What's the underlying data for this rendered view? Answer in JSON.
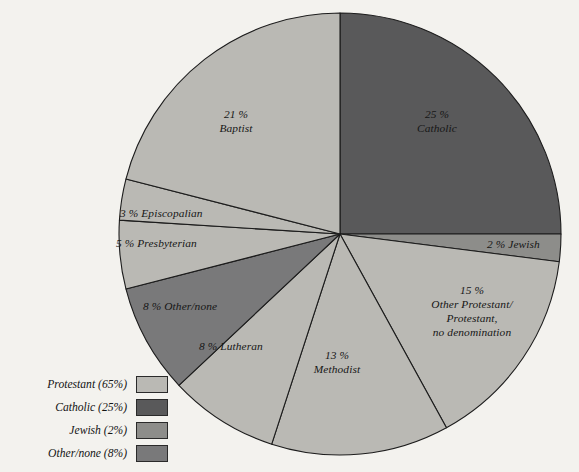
{
  "chart_data": {
    "type": "pie",
    "title": "",
    "subtitle": "",
    "xlabel": "",
    "ylabel": "",
    "units": "percent",
    "total": 100,
    "start_angle_deg": 0,
    "direction": "clockwise",
    "center": {
      "x": 340,
      "y": 234
    },
    "radius": 221,
    "categories": [
      "Catholic",
      "Jewish",
      "Other Protestant/ Protestant, no denomination",
      "Methodist",
      "Lutheran",
      "Other/none",
      "Presbyterian",
      "Episcopalian",
      "Baptist"
    ],
    "values": [
      25,
      2,
      15,
      13,
      8,
      8,
      5,
      3,
      21
    ],
    "slices": [
      {
        "id": "catholic",
        "value": 25,
        "value_label": "25%",
        "name": "Catholic",
        "group": "Catholic",
        "color": "#59595a",
        "start_deg": 0,
        "end_deg": 90,
        "label_lines": [
          "25 %",
          "Catholic"
        ],
        "label_align": "center",
        "label_x": 437,
        "label_y": 108,
        "label_inside": true
      },
      {
        "id": "jewish",
        "value": 2,
        "value_label": "2%",
        "name": "Jewish",
        "group": "Jewish",
        "color": "#8d8d8a",
        "start_deg": 90,
        "end_deg": 97.2,
        "label_lines": [
          "2 % Jewish"
        ],
        "label_align": "left",
        "label_x": 487,
        "label_y": 238,
        "label_inside": true
      },
      {
        "id": "other-protestant",
        "value": 15,
        "value_label": "15%",
        "name": "Other Protestant/ Protestant, no denomination",
        "group": "Protestant",
        "color": "#bab9b4",
        "start_deg": 97.2,
        "end_deg": 151.2,
        "label_lines": [
          "15 %",
          "Other Protestant/",
          "Protestant,",
          "no denomination"
        ],
        "label_align": "center",
        "label_x": 472,
        "label_y": 284,
        "label_inside": true
      },
      {
        "id": "methodist",
        "value": 13,
        "value_label": "13%",
        "name": "Methodist",
        "group": "Protestant",
        "color": "#bab9b4",
        "start_deg": 151.2,
        "end_deg": 198,
        "label_lines": [
          "13 %",
          "Methodist"
        ],
        "label_align": "center",
        "label_x": 337,
        "label_y": 349,
        "label_inside": true
      },
      {
        "id": "lutheran",
        "value": 8,
        "value_label": "8%",
        "name": "Lutheran",
        "group": "Protestant",
        "color": "#bab9b4",
        "start_deg": 198,
        "end_deg": 226.8,
        "label_lines": [
          "8 % Lutheran"
        ],
        "label_align": "left",
        "label_x": 199,
        "label_y": 340,
        "label_inside": true
      },
      {
        "id": "other-none",
        "value": 8,
        "value_label": "8%",
        "name": "Other/none",
        "group": "Other/none",
        "color": "#79797a",
        "start_deg": 226.8,
        "end_deg": 255.6,
        "label_lines": [
          "8 % Other/none"
        ],
        "label_align": "left",
        "label_x": 143,
        "label_y": 300,
        "label_inside": true
      },
      {
        "id": "presbyterian",
        "value": 5,
        "value_label": "5%",
        "name": "Presbyterian",
        "group": "Protestant",
        "color": "#bab9b4",
        "start_deg": 255.6,
        "end_deg": 273.6,
        "label_lines": [
          "5 % Presbyterian"
        ],
        "label_align": "left",
        "label_x": 116,
        "label_y": 237,
        "label_inside": true
      },
      {
        "id": "episcopalian",
        "value": 3,
        "value_label": "3%",
        "name": "Episcopalian",
        "group": "Protestant",
        "color": "#bab9b4",
        "start_deg": 273.6,
        "end_deg": 284.4,
        "label_lines": [
          "3 % Episcopalian"
        ],
        "label_align": "left",
        "label_x": 120,
        "label_y": 207,
        "label_inside": true
      },
      {
        "id": "baptist",
        "value": 21,
        "value_label": "21%",
        "name": "Baptist",
        "group": "Protestant",
        "color": "#bab9b4",
        "start_deg": 284.4,
        "end_deg": 360,
        "label_lines": [
          "21 %",
          "Baptist"
        ],
        "label_align": "center",
        "label_x": 236,
        "label_y": 108,
        "label_inside": true
      }
    ],
    "legend": {
      "position": "bottom-left",
      "entries": [
        {
          "label": "Protestant (65%)",
          "name": "Protestant",
          "value": 65,
          "color": "#bab9b4"
        },
        {
          "label": "Catholic (25%)",
          "name": "Catholic",
          "value": 25,
          "color": "#59595a"
        },
        {
          "label": "Jewish (2%)",
          "name": "Jewish",
          "value": 2,
          "color": "#8d8d8a"
        },
        {
          "label": "Other/none (8%)",
          "name": "Other/none",
          "value": 8,
          "color": "#79797a"
        }
      ]
    },
    "colors": {
      "background": "#f3f2ee",
      "outline": "#1c1c1c",
      "protestant": "#bab9b4",
      "catholic": "#59595a",
      "jewish": "#8d8d8a",
      "other_none": "#79797a",
      "text": "#141414"
    }
  }
}
